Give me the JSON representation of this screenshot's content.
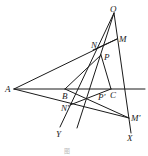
{
  "figure": {
    "caption": "图",
    "points": {
      "O": {
        "label": "O",
        "x": 114,
        "y": 13,
        "lx": 110,
        "ly": 12
      },
      "M": {
        "label": "M",
        "x": 117,
        "y": 39,
        "lx": 119,
        "ly": 42
      },
      "N": {
        "label": "N",
        "x": 99,
        "y": 47,
        "lx": 91,
        "ly": 48
      },
      "P": {
        "label": "P",
        "x": 101,
        "y": 55,
        "lx": 104,
        "ly": 60
      },
      "A": {
        "label": "A",
        "x": 14,
        "y": 89,
        "lx": 5,
        "ly": 92
      },
      "B": {
        "label": "B",
        "x": 65,
        "y": 89,
        "lx": 62,
        "ly": 99
      },
      "C": {
        "label": "C",
        "x": 111,
        "y": 89,
        "lx": 110,
        "ly": 98
      },
      "Pp": {
        "label": "P'",
        "x": 86,
        "y": 97,
        "lx": 98,
        "ly": 100
      },
      "Np": {
        "label": "N'",
        "x": 73,
        "y": 103,
        "lx": 61,
        "ly": 111
      },
      "Mp": {
        "label": "M'",
        "x": 129,
        "y": 118,
        "lx": 131,
        "ly": 121
      },
      "Y": {
        "label": "Y",
        "x": 60,
        "y": 127,
        "lx": 56,
        "ly": 137
      },
      "X": {
        "label": "X",
        "x": 131,
        "y": 133,
        "lx": 127,
        "ly": 141
      }
    }
  }
}
